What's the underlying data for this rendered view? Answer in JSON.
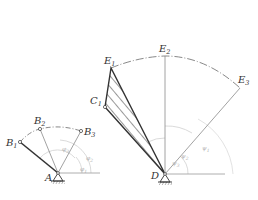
{
  "diagram": {
    "type": "mechanism-linkage-synthesis",
    "colors": {
      "main_line": "#333333",
      "thin_line": "#8a8a8a",
      "arc_line": "#6a6a6a",
      "angle_arc": "#cfcfcf",
      "angle_label": "#b0b0b0",
      "background": "#ffffff"
    },
    "left_mechanism": {
      "pivot": {
        "label": "A",
        "x": 58,
        "y": 173
      },
      "points": [
        {
          "id": "B1",
          "base": "B",
          "sub": "1",
          "x": 20,
          "y": 142
        },
        {
          "id": "B2",
          "base": "B",
          "sub": "2",
          "x": 40,
          "y": 129
        },
        {
          "id": "B3",
          "base": "B",
          "sub": "3",
          "x": 81,
          "y": 131
        }
      ],
      "angle_labels": [
        {
          "base": "φ",
          "sub": "1",
          "x": 80,
          "y": 172
        },
        {
          "base": "φ",
          "sub": "2",
          "x": 86,
          "y": 160
        },
        {
          "base": "φ",
          "sub": "3",
          "x": 62,
          "y": 152
        }
      ],
      "ray_end_x": 100
    },
    "right_mechanism": {
      "pivot": {
        "label": "D",
        "x": 165,
        "y": 174
      },
      "coupler_point": {
        "id": "C1",
        "base": "C",
        "sub": "1",
        "x": 105,
        "y": 107
      },
      "points": [
        {
          "id": "E1",
          "base": "E",
          "sub": "1",
          "x": 111,
          "y": 68
        },
        {
          "id": "E2",
          "base": "E",
          "sub": "2",
          "x": 165,
          "y": 56
        },
        {
          "id": "E3",
          "base": "E",
          "sub": "3",
          "x": 240,
          "y": 88
        }
      ],
      "angle_labels": [
        {
          "base": "ψ",
          "sub": "1",
          "x": 202,
          "y": 150
        },
        {
          "base": "ψ",
          "sub": "2",
          "x": 181,
          "y": 158
        },
        {
          "base": "ψ",
          "sub": "3",
          "x": 172,
          "y": 165
        }
      ],
      "ray_end_x": 225
    }
  }
}
